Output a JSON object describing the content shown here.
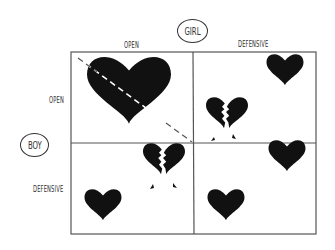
{
  "diagram": {
    "axes": {
      "column_axis_label": "GIRL",
      "row_axis_label": "BOY",
      "columns": [
        "OPEN",
        "DEFENSIVE"
      ],
      "rows": [
        "OPEN",
        "DEFENSIVE"
      ]
    },
    "cells": [
      {
        "row": "OPEN",
        "col": "OPEN",
        "content": "one large whole heart crossed by a dashed diagonal line"
      },
      {
        "row": "OPEN",
        "col": "DEFENSIVE",
        "content": "small whole heart (girl) and broken heart (boy)"
      },
      {
        "row": "DEFENSIVE",
        "col": "OPEN",
        "content": "broken heart (girl) and small whole heart (boy)"
      },
      {
        "row": "DEFENSIVE",
        "col": "DEFENSIVE",
        "content": "two separate small whole hearts"
      }
    ],
    "colors": {
      "ink": "#111111",
      "grid": "#555555",
      "background": "#ffffff"
    }
  }
}
